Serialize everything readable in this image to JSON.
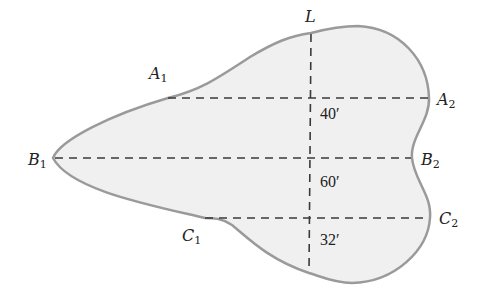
{
  "diagram": {
    "colors": {
      "fill": "#f0f0f0",
      "outline": "#9a9a9a",
      "dash": "#3a3a3a",
      "text": "#222222"
    },
    "points": {
      "L": {
        "name": "L",
        "sub": ""
      },
      "A1": {
        "name": "A",
        "sub": "1"
      },
      "A2": {
        "name": "A",
        "sub": "2"
      },
      "B1": {
        "name": "B",
        "sub": "1"
      },
      "B2": {
        "name": "B",
        "sub": "2"
      },
      "C1": {
        "name": "C",
        "sub": "1"
      },
      "C2": {
        "name": "C",
        "sub": "2"
      }
    },
    "measurements": {
      "LA": "40′",
      "AB": "60′",
      "BC": "32′"
    }
  }
}
